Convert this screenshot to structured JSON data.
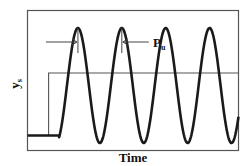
{
  "figure": {
    "xlabel": "Time",
    "ylabel_main": "y",
    "ylabel_sub": "s",
    "period_label_main": "P",
    "period_label_sub": "u",
    "colors": {
      "frame": "#555555",
      "response": "#1a1a1a",
      "setpoint": "#555555",
      "annotation": "#444444",
      "background": "#ffffff"
    }
  },
  "chart_data": {
    "type": "line",
    "title": "",
    "xlabel": "Time",
    "ylabel": "y_s",
    "grid": false,
    "legend": "none",
    "xlim": [
      0,
      10
    ],
    "ylim": [
      -1.2,
      1.6
    ],
    "series": [
      {
        "name": "setpoint-step",
        "kind": "step",
        "initial_value": -0.9,
        "final_value": 0.35,
        "step_time": 1.0
      },
      {
        "name": "response",
        "kind": "sustained-oscillation",
        "initial_value": -0.9,
        "oscillation_start": 1.5,
        "center": 0.35,
        "peak": 1.25,
        "trough": -1.05,
        "period": 2.08,
        "peak_times": [
          2.39,
          4.47,
          6.55,
          8.63
        ]
      }
    ],
    "annotations": [
      {
        "type": "period-marker",
        "label": "P_u",
        "from_peak": 1,
        "to_peak": 2
      }
    ]
  }
}
